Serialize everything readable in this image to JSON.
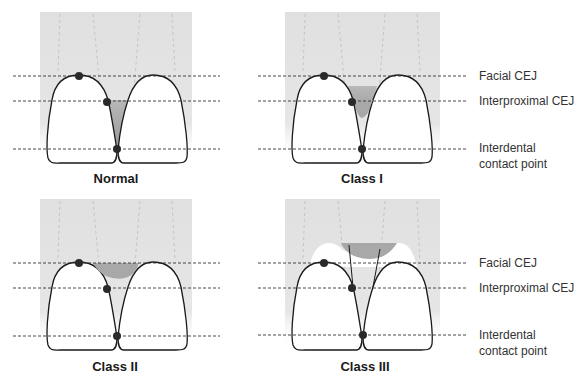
{
  "figure": {
    "panels": [
      {
        "id": "normal",
        "title": "Normal",
        "title_pos": [
          116,
          179
        ]
      },
      {
        "id": "class-1",
        "title": "Class I",
        "title_pos": [
          362,
          179
        ]
      },
      {
        "id": "class-2",
        "title": "Class II",
        "title_pos": [
          115,
          367
        ]
      },
      {
        "id": "class-3",
        "title": "Class III",
        "title_pos": [
          365,
          367
        ]
      }
    ],
    "legend_top": {
      "facial_cej": "Facial CEJ",
      "interproximal_cej": "Interproximal CEJ",
      "contact_line1": "Interdental",
      "contact_line2": "contact point"
    },
    "legend_bottom": {
      "facial_cej": "Facial CEJ",
      "interproximal_cej": "Interproximal CEJ",
      "contact_line1": "Interdental",
      "contact_line2": "contact point"
    },
    "colors": {
      "gingiva": "#e3e3e3",
      "papilla": "#a8a8a8",
      "tooth_fill": "#ffffff",
      "outline": "#1a1a1a",
      "dot": "#2a2a2a",
      "dashed_line": "#333333"
    }
  }
}
